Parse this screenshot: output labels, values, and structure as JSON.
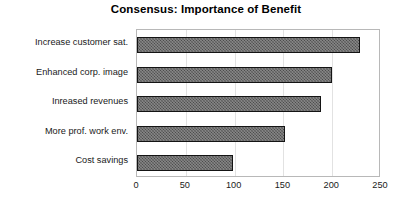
{
  "chart_data": {
    "type": "bar",
    "orientation": "horizontal",
    "title": "Consensus: Importance of Benefit",
    "xlabel": "",
    "ylabel": "",
    "categories": [
      "Increase customer sat.",
      "Enhanced corp. image",
      "Inreased revenues",
      "More prof. work env.",
      "Cost savings"
    ],
    "values": [
      228,
      200,
      189,
      152,
      98
    ],
    "xlim": [
      0,
      250
    ],
    "xticks": [
      0,
      50,
      100,
      150,
      200,
      250
    ],
    "xtick_labels": [
      "0",
      "50",
      "100",
      "150",
      "200",
      "250"
    ],
    "grid": "vertical-light",
    "legend": null,
    "bar_fill_color": "#4b4b4b",
    "bar_border_color": "#141414",
    "plot_border_color": "#b8b8b8",
    "gridline_color": "#e2e2e2",
    "background_color": "#ffffff",
    "text_color": "#1a1a1a"
  }
}
